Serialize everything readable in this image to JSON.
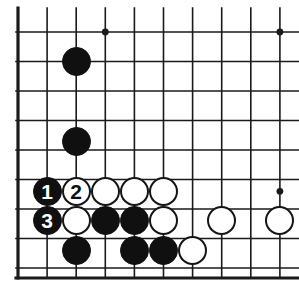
{
  "figure": {
    "kind": "go-board-diagram",
    "board_background": "#ffffff",
    "line_color": "#1a1a1a",
    "black_color": "#101010",
    "white_color": "#ffffff",
    "white_border_color": "#151515"
  },
  "geometry": {
    "width": 299,
    "height": 292,
    "origin_x": 18,
    "origin_y": 32,
    "step_x": 29.1,
    "step_y": 29.5,
    "cols": 10,
    "rows": 9,
    "stone_radius": 14.5,
    "edge_left_x": 18,
    "edge_bottom_y": 278,
    "thin_line_width": 1.6,
    "edge_line_width": 3.2
  },
  "star_points": [
    {
      "col": 3,
      "row": 0
    },
    {
      "col": 9,
      "row": 0
    },
    {
      "col": 9,
      "row": 5.4
    }
  ],
  "stones": [
    {
      "id": "b-corner-upper",
      "color": "black",
      "col": 2,
      "row": 1,
      "label": ""
    },
    {
      "id": "b-corner-lower",
      "color": "black",
      "col": 2,
      "row": 3.7,
      "label": ""
    },
    {
      "id": "move-1",
      "color": "black",
      "col": 1,
      "row": 5.4,
      "label": "1"
    },
    {
      "id": "move-2",
      "color": "white",
      "col": 2,
      "row": 5.4,
      "label": "2"
    },
    {
      "id": "w-r5-c3",
      "color": "white",
      "col": 3,
      "row": 5.4,
      "label": ""
    },
    {
      "id": "w-r5-c4",
      "color": "white",
      "col": 4,
      "row": 5.4,
      "label": ""
    },
    {
      "id": "w-r5-c5",
      "color": "white",
      "col": 5,
      "row": 5.4,
      "label": ""
    },
    {
      "id": "move-3",
      "color": "black",
      "col": 1,
      "row": 6.4,
      "label": "3"
    },
    {
      "id": "w-r6-c2",
      "color": "white",
      "col": 2,
      "row": 6.4,
      "label": ""
    },
    {
      "id": "b-r6-c3",
      "color": "black",
      "col": 3,
      "row": 6.4,
      "label": ""
    },
    {
      "id": "b-r6-c4",
      "color": "black",
      "col": 4,
      "row": 6.4,
      "label": ""
    },
    {
      "id": "w-r6-c5",
      "color": "white",
      "col": 5,
      "row": 6.4,
      "label": ""
    },
    {
      "id": "w-r6-c7",
      "color": "white",
      "col": 7,
      "row": 6.4,
      "label": ""
    },
    {
      "id": "w-r6-c9",
      "color": "white",
      "col": 9,
      "row": 6.4,
      "label": ""
    },
    {
      "id": "b-r7-c2",
      "color": "black",
      "col": 2,
      "row": 7.4,
      "label": ""
    },
    {
      "id": "b-r7-c4",
      "color": "black",
      "col": 4,
      "row": 7.4,
      "label": ""
    },
    {
      "id": "b-r7-c5",
      "color": "black",
      "col": 5,
      "row": 7.4,
      "label": ""
    },
    {
      "id": "w-r7-c6",
      "color": "white",
      "col": 6,
      "row": 7.4,
      "label": ""
    }
  ],
  "move_labels": {
    "move_1": "1",
    "move_2": "2",
    "move_3": "3"
  }
}
